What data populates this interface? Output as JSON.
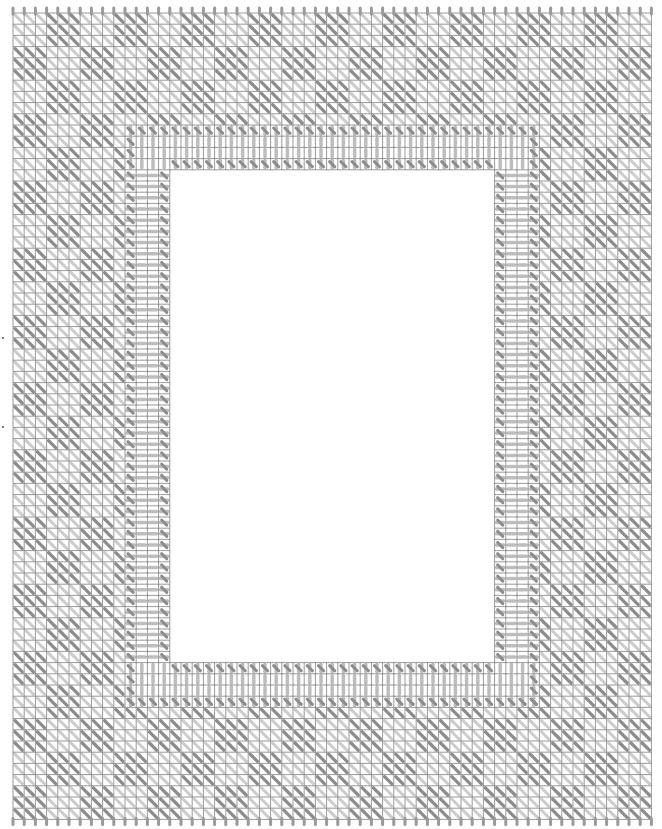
{
  "chart_data": {
    "type": "stitch-chart",
    "title": "",
    "grid": {
      "origin_x": 13,
      "origin_y": 13,
      "cell_size": 11.2,
      "cols": 57,
      "rows": 72,
      "line_color": "#555555"
    },
    "motif": {
      "repeat": 6,
      "block": 3,
      "offset_col": 3,
      "offset_row": 0,
      "light_stitch_color": "#cccccc",
      "dark_stitch_color": "#8c8c8c"
    },
    "band": {
      "outer_left_col": 10,
      "outer_top_row": 10,
      "outer_right_col": 47,
      "outer_bottom_row": 62,
      "width_cells": 4,
      "straight_stitch_color": "#bdbdbd",
      "edge_stitch_color": "#8c8c8c"
    },
    "center_opening": {
      "x": 170,
      "y": 178,
      "width": 327,
      "height": 474,
      "fill": "#ffffff"
    },
    "edge_stitches_color": "#9a9a9a",
    "center_markers": [
      {
        "x": 2,
        "y": 337
      },
      {
        "x": 2,
        "y": 426
      }
    ]
  }
}
